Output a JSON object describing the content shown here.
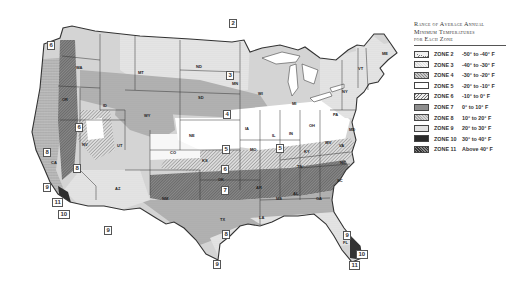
{
  "legend": {
    "title_line1": "Range of Average Annual",
    "title_line2": "Minimum Temperatures",
    "title_line3": "for Each Zone",
    "zones": [
      {
        "name": "ZONE 2",
        "range": "-50° to -40° F",
        "fill": "#e9e9e9"
      },
      {
        "name": "ZONE 3",
        "range": "-40° to -30° F",
        "fill": "#dcdcdc"
      },
      {
        "name": "ZONE 4",
        "range": "-30° to -20° F",
        "fill": "#bdbdbd"
      },
      {
        "name": "ZONE 5",
        "range": "-20° to -10° F",
        "fill": "#ffffff"
      },
      {
        "name": "ZONE 6",
        "range": "-10° to 0° F",
        "fill": "#cfcfcf"
      },
      {
        "name": "ZONE 7",
        "range": "0° to 10° F",
        "fill": "#8f8f8f"
      },
      {
        "name": "ZONE 8",
        "range": "10° to 20° F",
        "fill": "#c7c7c7"
      },
      {
        "name": "ZONE 9",
        "range": "20° to 30° F",
        "fill": "#e3e3e3"
      },
      {
        "name": "ZONE 10",
        "range": "30° to 40° F",
        "fill": "#2e2e2e"
      },
      {
        "name": "ZONE 11",
        "range": "Above 40° F",
        "fill": "#5a5a5a"
      }
    ]
  },
  "map_labels": {
    "zone_boxes": [
      {
        "text": "2",
        "x": 229,
        "y": 19
      },
      {
        "text": "3",
        "x": 226,
        "y": 71
      },
      {
        "text": "4",
        "x": 223,
        "y": 110
      },
      {
        "text": "5",
        "x": 222,
        "y": 145
      },
      {
        "text": "6",
        "x": 75,
        "y": 123
      },
      {
        "text": "6",
        "x": 47,
        "y": 41
      },
      {
        "text": "5",
        "x": 276,
        "y": 144
      },
      {
        "text": "6",
        "x": 221,
        "y": 165
      },
      {
        "text": "7",
        "x": 221,
        "y": 186
      },
      {
        "text": "8",
        "x": 73,
        "y": 164
      },
      {
        "text": "8",
        "x": 222,
        "y": 230
      },
      {
        "text": "8",
        "x": 43,
        "y": 148
      },
      {
        "text": "9",
        "x": 43,
        "y": 183
      },
      {
        "text": "9",
        "x": 104,
        "y": 226
      },
      {
        "text": "9",
        "x": 213,
        "y": 260
      },
      {
        "text": "9",
        "x": 343,
        "y": 231
      },
      {
        "text": "10",
        "x": 356,
        "y": 250
      },
      {
        "text": "11",
        "x": 349,
        "y": 261
      },
      {
        "text": "11",
        "x": 52,
        "y": 198
      },
      {
        "text": "10",
        "x": 58,
        "y": 210
      }
    ],
    "states": [
      {
        "text": "WA",
        "x": 76,
        "y": 65
      },
      {
        "text": "OR",
        "x": 62,
        "y": 97
      },
      {
        "text": "ID",
        "x": 103,
        "y": 103
      },
      {
        "text": "MT",
        "x": 138,
        "y": 70
      },
      {
        "text": "ND",
        "x": 196,
        "y": 64
      },
      {
        "text": "SD",
        "x": 198,
        "y": 95
      },
      {
        "text": "WY",
        "x": 144,
        "y": 113
      },
      {
        "text": "NV",
        "x": 82,
        "y": 142
      },
      {
        "text": "UT",
        "x": 117,
        "y": 143
      },
      {
        "text": "CO",
        "x": 170,
        "y": 150
      },
      {
        "text": "NE",
        "x": 189,
        "y": 133
      },
      {
        "text": "KS",
        "x": 202,
        "y": 158
      },
      {
        "text": "CA",
        "x": 51,
        "y": 160
      },
      {
        "text": "AZ",
        "x": 115,
        "y": 186
      },
      {
        "text": "NM",
        "x": 162,
        "y": 196
      },
      {
        "text": "OK",
        "x": 218,
        "y": 177
      },
      {
        "text": "TX",
        "x": 220,
        "y": 217
      },
      {
        "text": "MN",
        "x": 232,
        "y": 81
      },
      {
        "text": "IA",
        "x": 245,
        "y": 126
      },
      {
        "text": "MO",
        "x": 250,
        "y": 147
      },
      {
        "text": "AR",
        "x": 256,
        "y": 185
      },
      {
        "text": "LA",
        "x": 259,
        "y": 215
      },
      {
        "text": "WI",
        "x": 258,
        "y": 91
      },
      {
        "text": "IL",
        "x": 272,
        "y": 133
      },
      {
        "text": "MS",
        "x": 276,
        "y": 196
      },
      {
        "text": "MI",
        "x": 292,
        "y": 101
      },
      {
        "text": "IN",
        "x": 289,
        "y": 131
      },
      {
        "text": "OH",
        "x": 309,
        "y": 123
      },
      {
        "text": "KY",
        "x": 304,
        "y": 149
      },
      {
        "text": "TN",
        "x": 297,
        "y": 164
      },
      {
        "text": "AL",
        "x": 293,
        "y": 191
      },
      {
        "text": "GA",
        "x": 316,
        "y": 196
      },
      {
        "text": "FL",
        "x": 343,
        "y": 240
      },
      {
        "text": "SC",
        "x": 337,
        "y": 178
      },
      {
        "text": "NC",
        "x": 340,
        "y": 160
      },
      {
        "text": "VA",
        "x": 339,
        "y": 143
      },
      {
        "text": "WV",
        "x": 325,
        "y": 140
      },
      {
        "text": "PA",
        "x": 333,
        "y": 112
      },
      {
        "text": "NY",
        "x": 342,
        "y": 89
      },
      {
        "text": "VT",
        "x": 358,
        "y": 66
      },
      {
        "text": "ME",
        "x": 382,
        "y": 51
      },
      {
        "text": "MD",
        "x": 349,
        "y": 127
      }
    ]
  }
}
